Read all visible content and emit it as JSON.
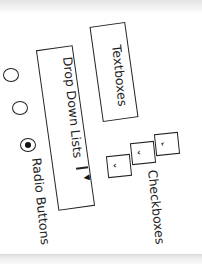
{
  "diagram": {
    "title": "",
    "elements": [
      {
        "id": "textboxes",
        "label": "Textboxes",
        "shape": "rectangle"
      },
      {
        "id": "dropdown",
        "label": "Drop Down Lists",
        "shape": "rectangle",
        "suffix_divider": "|",
        "arrow": "▼"
      },
      {
        "id": "radio",
        "label": "Radio Buttons",
        "shape": "radio-circles",
        "count": 3,
        "selected_index": 2
      },
      {
        "id": "checkboxes",
        "label": "Checkboxes",
        "shape": "checkbox-squares",
        "count": 3,
        "check_glyph": "‹"
      }
    ]
  },
  "labels": {
    "textboxes": "Textboxes",
    "dropdown": "Drop Down Lists",
    "dropdown_divider": "|",
    "dropdown_arrow": "▼",
    "radio": "Radio Buttons",
    "checkboxes": "Checkboxes",
    "check_glyph": "‹"
  },
  "colors": {
    "ink": "#222222",
    "paper": "#ffffff",
    "scan_band": "#e4e4e4"
  }
}
